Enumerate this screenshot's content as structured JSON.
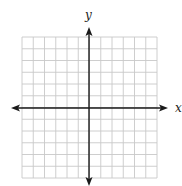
{
  "figure": {
    "type": "coordinate-plane",
    "x_axis_label": "x",
    "y_axis_label": "y",
    "grid": {
      "columns": 12,
      "rows": 12,
      "columns_left_of_y_axis": 6,
      "columns_right_of_y_axis": 6,
      "rows_above_x_axis": 6,
      "rows_below_x_axis": 6
    },
    "colors": {
      "grid_line": "#c8c8c8",
      "axis": "#1a1a1a",
      "background": "#ffffff"
    }
  }
}
